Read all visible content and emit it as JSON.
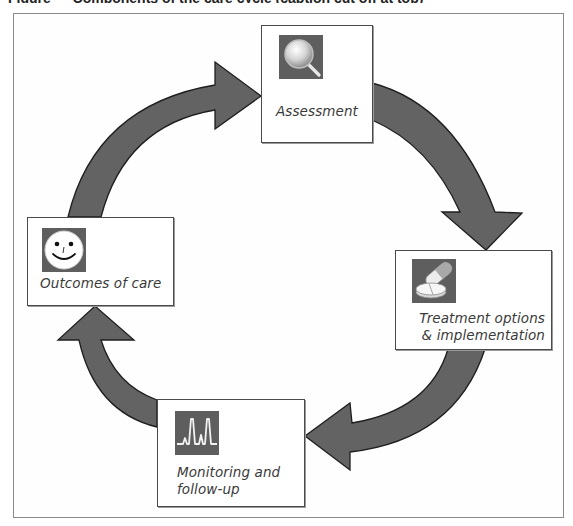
{
  "figure": {
    "caption_partial": "Figure — Components of the care cycle (caption cut off at top)",
    "diagram_type": "cycle",
    "direction": "clockwise",
    "colors": {
      "arrow_fill": "#636363",
      "arrow_stroke": "#1e1e1e",
      "icon_bg": "#5e5e5e",
      "box_border": "#4a4a4a",
      "frame_border": "#8a8a8a",
      "label_text": "#3a3a3a"
    }
  },
  "nodes": [
    {
      "id": "assessment",
      "label": "Assessment",
      "icon": "magnifying-glass-icon"
    },
    {
      "id": "treatment",
      "label": "Treatment options\n& implementation",
      "icon": "pill-tablet-icon"
    },
    {
      "id": "monitoring",
      "label": "Monitoring and\nfollow-up",
      "icon": "heartbeat-monitor-icon"
    },
    {
      "id": "outcomes",
      "label": "Outcomes of care",
      "icon": "smiley-face-icon"
    }
  ],
  "edges": [
    {
      "from": "assessment",
      "to": "treatment"
    },
    {
      "from": "treatment",
      "to": "monitoring"
    },
    {
      "from": "monitoring",
      "to": "outcomes"
    },
    {
      "from": "outcomes",
      "to": "assessment"
    }
  ]
}
